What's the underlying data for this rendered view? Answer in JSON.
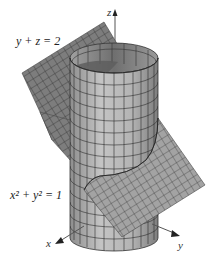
{
  "figure": {
    "labels": {
      "plane_eq": "y + z = 2",
      "cylinder_eq": "x² + y² = 1"
    },
    "axes": {
      "x": "x",
      "y": "y",
      "z": "z"
    },
    "colors": {
      "plane_fill": "#7a7a7a",
      "plane_front_fill": "#9a9a9a",
      "cylinder_fill": "#b0b0b0",
      "cylinder_inner_fill": "#8a8a8a",
      "grid_line": "#333333",
      "axis": "#444444"
    }
  }
}
